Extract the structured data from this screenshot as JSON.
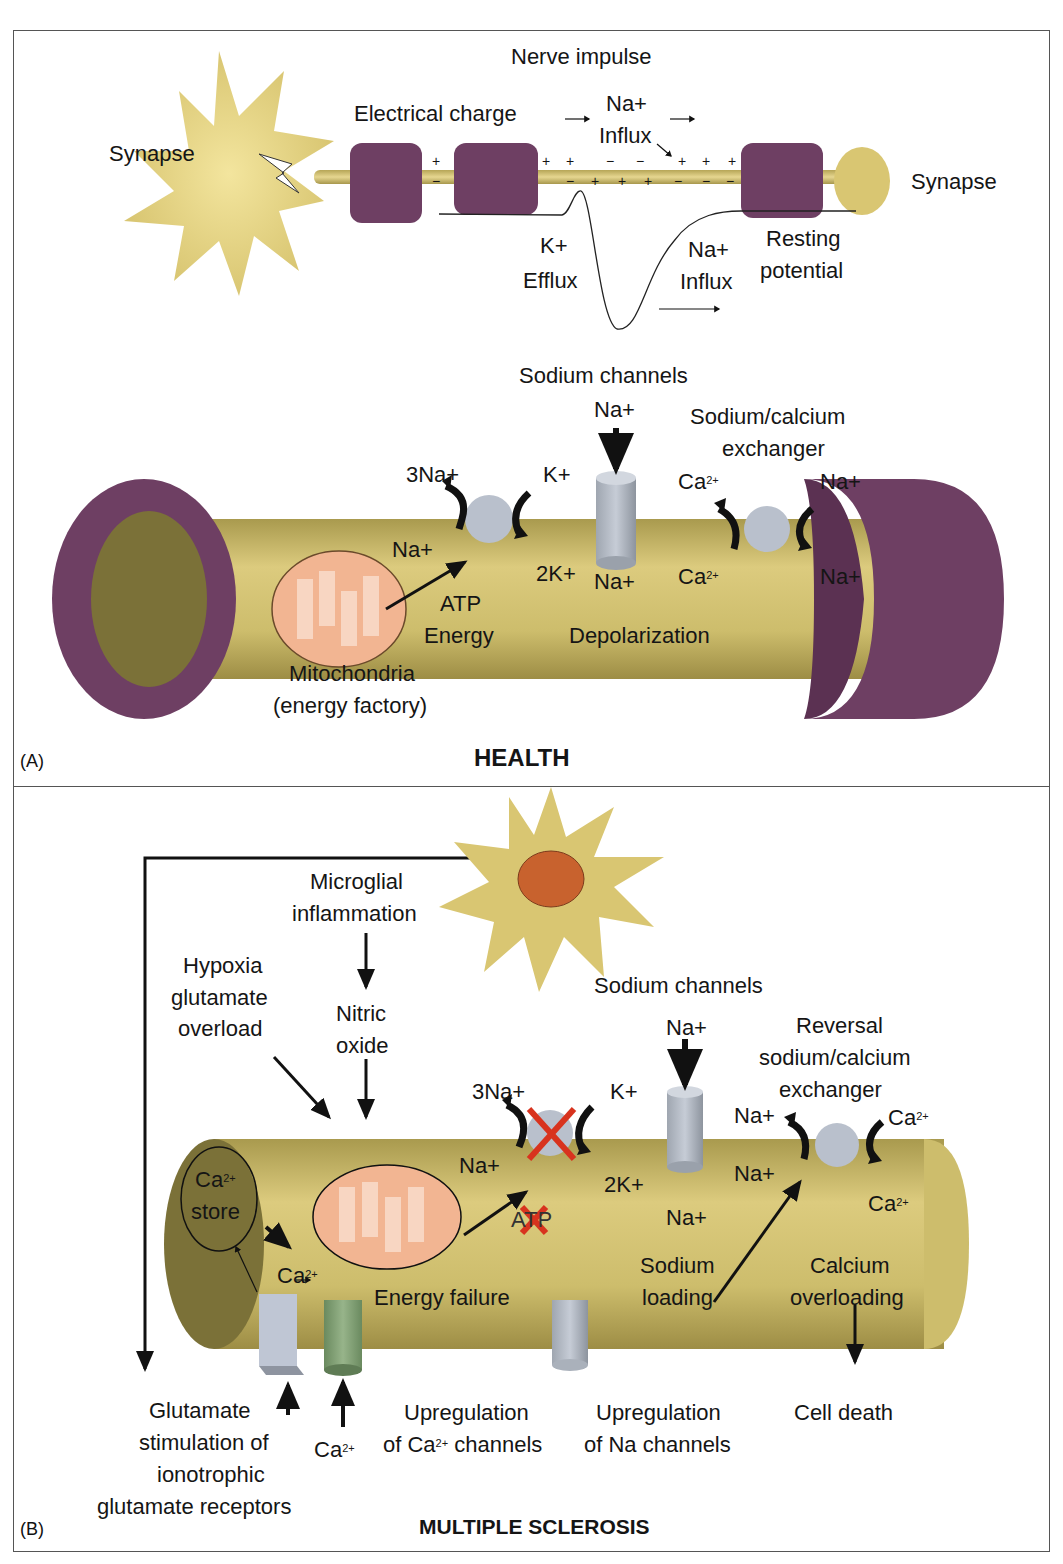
{
  "figure": {
    "panel_a": {
      "letter": "(A)",
      "title": "HEALTH",
      "nerve_impulse": {
        "title": "Nerve impulse",
        "synapse_left": "Synapse",
        "synapse_right": "Synapse",
        "electrical_charge": "Electrical charge",
        "na_influx_top_1": "Na+",
        "na_influx_top_2": "Influx",
        "k_efflux_1": "K+",
        "k_efflux_2": "Efflux",
        "na_influx_bottom_1": "Na+",
        "na_influx_bottom_2": "Influx",
        "resting_1": "Resting",
        "resting_2": "potential",
        "charges_top": [
          "+",
          "+",
          "+",
          "−",
          "−",
          "+",
          "+",
          "+"
        ],
        "charges_bottom": [
          "−",
          "−",
          "+",
          "+",
          "+",
          "−",
          "−",
          "−"
        ]
      },
      "axon": {
        "sodium_channels": "Sodium channels",
        "na_top": "Na+",
        "na_bottom": "Na+",
        "pump_3na": "3Na+",
        "pump_na": "Na+",
        "pump_k": "K+",
        "pump_2k": "2K+",
        "atp": "ATP",
        "energy": "Energy",
        "depolarization": "Depolarization",
        "exchanger_1": "Sodium/calcium",
        "exchanger_2": "exchanger",
        "ex_ca_top": "Ca",
        "ex_ca_bottom": "Ca",
        "ca_sup": "2+",
        "ex_na_top": "Na+",
        "ex_na_bottom": "Na+",
        "mito_1": "Mitochondria",
        "mito_2": "(energy factory)"
      }
    },
    "panel_b": {
      "letter": "(B)",
      "title": "MULTIPLE SCLEROSIS",
      "microglial_1": "Microglial",
      "microglial_2": "inflammation",
      "nitric_1": "Nitric",
      "nitric_2": "oxide",
      "hypoxia_1": "Hypoxia",
      "hypoxia_2": "glutamate",
      "hypoxia_3": "overload",
      "sodium_channels": "Sodium channels",
      "na_top": "Na+",
      "na_bottom": "Na+",
      "pump_3na": "3Na+",
      "pump_na": "Na+",
      "pump_k": "K+",
      "pump_2k": "2K+",
      "atp": "ATP",
      "reversal_1": "Reversal",
      "reversal_2": "sodium/calcium",
      "reversal_3": "exchanger",
      "ex_na_top": "Na+",
      "ex_na_bottom": "Na+",
      "ex_ca_top": "Ca",
      "ex_ca_bottom": "Ca",
      "ca_sup": "2+",
      "ca_store_1": "Ca",
      "ca_store_2": "store",
      "ca_inner": "Ca",
      "energy_failure": "Energy failure",
      "sodium_loading_1": "Sodium",
      "sodium_loading_2": "loading",
      "calcium_overloading_1": "Calcium",
      "calcium_overloading_2": "overloading",
      "cell_death": "Cell death",
      "glutamate_1": "Glutamate",
      "glutamate_2": "stimulation of",
      "glutamate_3": "ionotrophic",
      "glutamate_4": "glutamate receptors",
      "ca_entry": "Ca",
      "upreg_ca_1": "Upregulation",
      "upreg_ca_2": "of Ca",
      "upreg_ca_3": " channels",
      "upreg_na_1": "Upregulation",
      "upreg_na_2": "of Na channels"
    },
    "colors": {
      "axon": "#c9b865",
      "myelin": "#6e3f63",
      "channel": "#b9c0cc",
      "mito": "#f2b592",
      "red_x": "#d8331e",
      "microglia": "#c8622e",
      "ca_channel": "#7e9e72"
    }
  }
}
